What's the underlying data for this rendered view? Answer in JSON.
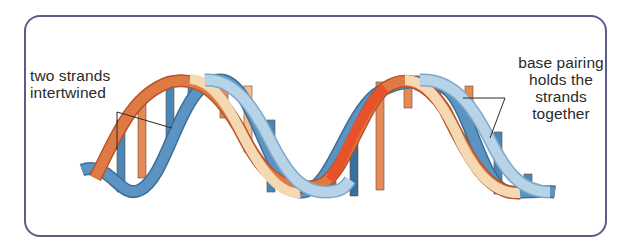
{
  "diagram": {
    "labels": {
      "left": {
        "line1": "two strands",
        "line2": "intertwined"
      },
      "right": {
        "line1": "base pairing",
        "line2": "holds the",
        "line3": "strands",
        "line4": "together"
      }
    },
    "colors": {
      "frame_border": "#5f5a8c",
      "strand_blue": "#4a86b8",
      "strand_light_blue": "#b7d3e8",
      "strand_orange": "#e2683a",
      "strand_cream": "#f5d9b3",
      "base_orange": "#e48a55",
      "base_blue": "#4a86b8",
      "text": "#2a2a2a"
    }
  }
}
